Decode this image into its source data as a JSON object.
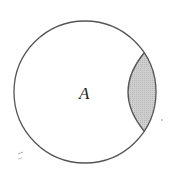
{
  "diagram": {
    "type": "set-diagram",
    "sets": [
      {
        "label": "A",
        "shape": "circle",
        "cx": 85,
        "cy": 92,
        "r": 71
      }
    ],
    "shaded_region": {
      "description": "lens-shaped region at right edge of circle A",
      "fill": "#c8c8c8",
      "top_point": [
        144,
        53
      ],
      "bottom_point": [
        144,
        131
      ],
      "inner_arc_leftmost_x": 126
    },
    "colors": {
      "stroke": "#555555",
      "shade": "#c8c8c8",
      "background": "#ffffff"
    }
  },
  "labels": {
    "set_a": "A"
  }
}
